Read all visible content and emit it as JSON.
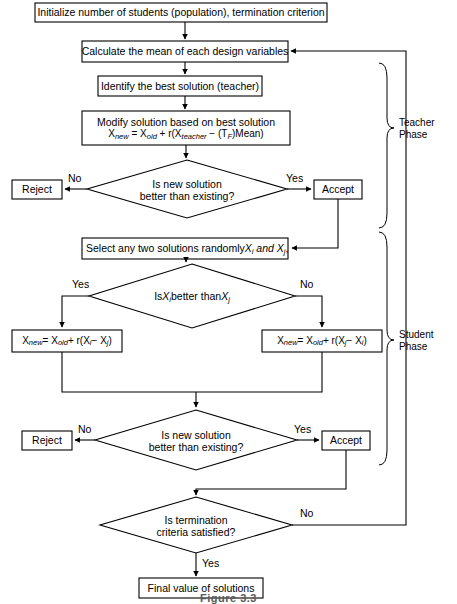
{
  "figure": {
    "caption": "Figure 3.3",
    "type": "flowchart"
  },
  "nodes": {
    "initialize": {
      "id": "initialize",
      "shape": "process",
      "text": "Initialize number of students (population), termination criterion",
      "x": 35,
      "y": 3,
      "w": 292,
      "h": 19
    },
    "calculate_mean": {
      "id": "calculate_mean",
      "shape": "process",
      "text": "Calculate the mean of each design variables",
      "x": 82,
      "y": 41,
      "w": 206,
      "h": 21
    },
    "identify_best": {
      "id": "identify_best",
      "shape": "process",
      "text": "Identify the best solution (teacher)",
      "x": 98,
      "y": 76,
      "w": 164,
      "h": 20
    },
    "modify_solution": {
      "id": "modify_solution",
      "shape": "process",
      "line1": "Modify solution based on best solution",
      "formula_html": "X<span class=\"sub\">new</span> = X<span class=\"sub\">old</span> + r(X<span class=\"sub\">teacher</span> − (T<span class=\"sub\">F</span>)Mean)",
      "formula_plain": "Xnew = Xold + r(Xteacher − (TF)Mean)",
      "x": 82,
      "y": 111,
      "w": 208,
      "h": 34
    },
    "decision_teacher": {
      "id": "decision_teacher",
      "shape": "decision",
      "line1": "Is new solution",
      "line2": "better than existing?",
      "cx": 187,
      "cy": 189,
      "rx": 100,
      "ry": 29
    },
    "reject_teacher": {
      "id": "reject_teacher",
      "shape": "process",
      "text": "Reject",
      "x": 12,
      "y": 180,
      "w": 50,
      "h": 19
    },
    "accept_teacher": {
      "id": "accept_teacher",
      "shape": "process",
      "text": "Accept",
      "x": 314,
      "y": 180,
      "w": 48,
      "h": 19
    },
    "select_two": {
      "id": "select_two",
      "shape": "process",
      "text_html": "Select any two solutions randomly <span class=\"ital\">X<span class=\"sub\">i</span> and X<span class=\"sub\">j</span></span> ,",
      "text_plain": "Select any two solutions randomly Xi and Xj ,",
      "x": 82,
      "y": 238,
      "w": 206,
      "h": 21
    },
    "decision_student": {
      "id": "decision_student",
      "shape": "decision",
      "text_html": "Is <span class=\"ital\">X<span class=\"sub\">i</span></span> better than <span class=\"ital\">X<span class=\"sub\">j</span></span>",
      "text_plain": "Is Xi better than Xj",
      "cx": 192,
      "cy": 296,
      "rx": 103,
      "ry": 32
    },
    "formula_left": {
      "id": "formula_left",
      "shape": "process",
      "formula_html": "X<span class=\"sub\">new</span> = X<span class=\"sub\">old</span> + r(X<span class=\"sub\">i</span> − X<span class=\"sub\">j</span>)",
      "formula_plain": "Xnew = Xold + r(Xi − Xj)",
      "x": 12,
      "y": 330,
      "w": 110,
      "h": 22
    },
    "formula_right": {
      "id": "formula_right",
      "shape": "process",
      "formula_html": "X<span class=\"sub\">new</span> = X<span class=\"sub\">old</span> + r(X<span class=\"sub\">j</span> − X<span class=\"sub\">i</span>)",
      "formula_plain": "Xnew = Xold + r(Xj − Xi)",
      "x": 262,
      "y": 330,
      "w": 120,
      "h": 22
    },
    "decision_student_accept": {
      "id": "decision_student_accept",
      "shape": "decision",
      "line1": "Is new solution",
      "line2": "better than existing?",
      "cx": 196,
      "cy": 440,
      "rx": 101,
      "ry": 30
    },
    "reject_student": {
      "id": "reject_student",
      "shape": "process",
      "text": "Reject",
      "x": 22,
      "y": 431,
      "w": 50,
      "h": 19
    },
    "accept_student": {
      "id": "accept_student",
      "shape": "process",
      "text": "Accept",
      "x": 322,
      "y": 431,
      "w": 48,
      "h": 19
    },
    "decision_termination": {
      "id": "decision_termination",
      "shape": "decision",
      "line1": "Is termination",
      "line2": "criteria satisfied?",
      "cx": 196,
      "cy": 525,
      "rx": 96,
      "ry": 28
    },
    "final_value": {
      "id": "final_value",
      "shape": "process",
      "text": "Final value of solutions",
      "x": 139,
      "y": 578,
      "w": 124,
      "h": 20
    }
  },
  "edge_labels": {
    "teacher_no": "No",
    "teacher_yes": "Yes",
    "student_yes": "Yes",
    "student_no": "No",
    "accept_no": "No",
    "accept_yes": "Yes",
    "termination_no": "No",
    "termination_yes": "Yes"
  },
  "phases": {
    "teacher": {
      "line1": "Teacher",
      "line2": "Phase"
    },
    "student": {
      "line1": "Student",
      "line2": "Phase"
    }
  },
  "style": {
    "stroke": "#000000",
    "background": "#ffffff",
    "text_color": "#000000",
    "caption_color": "#5a5a5a"
  }
}
